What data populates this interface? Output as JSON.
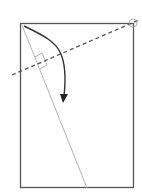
{
  "diagram": {
    "type": "folding-instruction",
    "elements": [
      "paper-rectangle",
      "diagonal-fold-line",
      "dashed-fold-line",
      "right-angle-marker",
      "corner-circle-marker",
      "curved-fold-arrow"
    ]
  },
  "colors": {
    "outline": "#555555",
    "diagonal": "#aaaaaa",
    "arrow": "#333333",
    "dashed": "#555555"
  }
}
